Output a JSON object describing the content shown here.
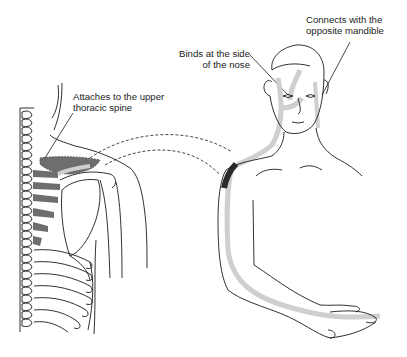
{
  "figure": {
    "labels": {
      "mandible": [
        "Connects with the",
        "opposite mandible"
      ],
      "nose": [
        "Binds at the side",
        "of the nose"
      ],
      "spine": [
        "Attaches to the upper",
        "thoracic spine"
      ]
    },
    "colors": {
      "line": "#1a1a1a",
      "muscle_dark": "#6e6e6e",
      "meridian_light": "#cfcfcf",
      "meridian_dark": "#2a2a2a"
    }
  }
}
